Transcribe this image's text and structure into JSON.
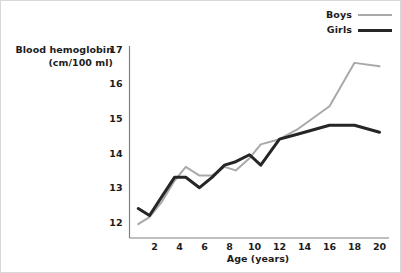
{
  "chart_data": {
    "type": "line",
    "title": "",
    "ylabel": "Blood hemoglobin (cm/100 ml)",
    "ylabel_line1": "Blood hemoglobin",
    "ylabel_line2": "(cm/100 ml)",
    "xlabel": "Age (years)",
    "xlim": [
      0,
      20.6
    ],
    "ylim": [
      11.55,
      17
    ],
    "xticks": [
      2,
      4,
      6,
      8,
      10,
      12,
      14,
      16,
      18,
      20
    ],
    "yticks": [
      12,
      13,
      14,
      15,
      16,
      17
    ],
    "xtick_labels": [
      "2",
      "4",
      "6",
      "8",
      "10",
      "12",
      "14",
      "16",
      "18",
      "20"
    ],
    "ytick_labels": [
      "12",
      "13",
      "14",
      "15",
      "16",
      "17"
    ],
    "grid": false,
    "legend_position": "top-right",
    "legend": [
      "Boys",
      "Girls"
    ],
    "series": [
      {
        "name": "Boys",
        "color": "#a9a9a9",
        "width": 2,
        "x": [
          0.7,
          1.6,
          2.6,
          3.6,
          4.5,
          5.6,
          6.6,
          7.6,
          8.5,
          9.6,
          10.5,
          12.0,
          13.5,
          16.0,
          18.0,
          20.0
        ],
        "y": [
          11.95,
          12.15,
          12.6,
          13.2,
          13.6,
          13.35,
          13.35,
          13.6,
          13.5,
          13.85,
          14.25,
          14.4,
          14.7,
          15.35,
          16.6,
          16.5
        ]
      },
      {
        "name": "Girls",
        "color": "#262626",
        "width": 3,
        "x": [
          0.7,
          1.6,
          2.6,
          3.6,
          4.5,
          5.6,
          6.6,
          7.6,
          8.5,
          9.6,
          10.5,
          12.0,
          13.5,
          16.0,
          18.0,
          20.0
        ],
        "y": [
          12.4,
          12.2,
          12.75,
          13.3,
          13.3,
          13.0,
          13.3,
          13.65,
          13.75,
          13.95,
          13.65,
          14.4,
          14.55,
          14.8,
          14.8,
          14.6
        ]
      }
    ]
  },
  "legend": {
    "items": [
      {
        "label": "Boys",
        "swatch": "boys"
      },
      {
        "label": "Girls",
        "swatch": "girls"
      }
    ]
  }
}
